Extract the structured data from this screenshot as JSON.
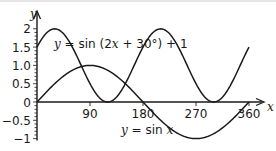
{
  "chart_data": {
    "type": "line",
    "title": "",
    "xlabel": "x",
    "ylabel": "y",
    "xlim": [
      0,
      360
    ],
    "ylim": [
      -1,
      2
    ],
    "grid": false,
    "x_ticks": [
      90,
      180,
      270,
      360
    ],
    "x_tick_labels": [
      "90",
      "180",
      "270",
      "360"
    ],
    "y_ticks": [
      -1,
      -0.5,
      0,
      0.5,
      1.0,
      1.5,
      2
    ],
    "y_tick_labels": [
      "−1",
      "−0.5",
      "0",
      "0.5",
      "1.0",
      "1.5",
      "2"
    ],
    "series": [
      {
        "name": "y = sin (2x + 30°) + 1",
        "expression": "sin(2x + 30) + 1",
        "x": [
          0,
          15,
          30,
          45,
          60,
          75,
          90,
          105,
          120,
          135,
          150,
          165,
          180,
          195,
          210,
          225,
          240,
          255,
          270,
          285,
          300,
          315,
          330,
          345,
          360
        ],
        "values": [
          1.5,
          1.87,
          2.0,
          1.87,
          1.5,
          1.0,
          0.5,
          0.13,
          0.0,
          0.13,
          0.5,
          1.0,
          1.5,
          1.87,
          2.0,
          1.87,
          1.5,
          1.0,
          0.5,
          0.13,
          0.0,
          0.13,
          0.5,
          1.0,
          1.5
        ]
      },
      {
        "name": "y = sin x",
        "expression": "sin(x)",
        "x": [
          0,
          15,
          30,
          45,
          60,
          75,
          90,
          105,
          120,
          135,
          150,
          165,
          180,
          195,
          210,
          225,
          240,
          255,
          270,
          285,
          300,
          315,
          330,
          345,
          360
        ],
        "values": [
          0.0,
          0.26,
          0.5,
          0.71,
          0.87,
          0.97,
          1.0,
          0.97,
          0.87,
          0.71,
          0.5,
          0.26,
          0.0,
          -0.26,
          -0.5,
          -0.71,
          -0.87,
          -0.97,
          -1.0,
          -0.97,
          -0.87,
          -0.71,
          -0.5,
          -0.26,
          0.0
        ]
      }
    ],
    "annotations": [
      {
        "text": "y = sin (2x + 30°) + 1",
        "near_x": 45,
        "near_y": 1.5
      },
      {
        "text": "y = sin x",
        "near_x": 170,
        "near_y": -0.75
      }
    ]
  },
  "labels": {
    "curve1_prefix": "y",
    "curve1_text": " = sin (2",
    "curve1_var": "x",
    "curve1_suffix": " + 30°) + 1",
    "curve2_prefix": "y",
    "curve2_text": " = sin ",
    "curve2_var": "x",
    "x_axis_letter": "x",
    "y_axis_letter": "y"
  }
}
